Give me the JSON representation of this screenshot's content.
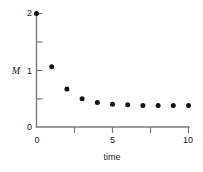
{
  "chart_data": {
    "type": "scatter",
    "title": "",
    "xlabel": "time",
    "ylabel": "M",
    "xlim": [
      0,
      10.5
    ],
    "ylim": [
      0,
      2.05
    ],
    "grid": false,
    "legend": null,
    "x": [
      0,
      1,
      2,
      3,
      4,
      5,
      6,
      7,
      8,
      9,
      10
    ],
    "values": [
      2.0,
      1.06,
      0.67,
      0.5,
      0.43,
      0.4,
      0.39,
      0.38,
      0.38,
      0.38,
      0.38
    ],
    "series": [
      {
        "name": "M",
        "values": [
          2.0,
          1.06,
          0.67,
          0.5,
          0.43,
          0.4,
          0.39,
          0.38,
          0.38,
          0.38,
          0.38
        ]
      }
    ],
    "marker": "filled-circle",
    "marker_color": "#141414",
    "axis_color": "#7a7a7a",
    "x_ticks": [
      {
        "value": 0,
        "label": "0",
        "major": true
      },
      {
        "value": 2.5,
        "label": "",
        "major": false
      },
      {
        "value": 5,
        "label": "5",
        "major": true
      },
      {
        "value": 7.5,
        "label": "",
        "major": false
      },
      {
        "value": 10,
        "label": "10",
        "major": true
      }
    ],
    "y_ticks": [
      {
        "value": 0,
        "label": "0",
        "major": true
      },
      {
        "value": 0.5,
        "label": "",
        "major": false
      },
      {
        "value": 1,
        "label": "1",
        "major": true
      },
      {
        "value": 1.5,
        "label": "",
        "major": false
      },
      {
        "value": 2,
        "label": "2",
        "major": true
      }
    ]
  },
  "labels": {
    "y_axis_title": "M",
    "x_axis_title": "time",
    "y_tick_0": "0",
    "y_tick_1": "1",
    "y_tick_2": "2",
    "x_tick_0": "0",
    "x_tick_5": "5",
    "x_tick_10": "10"
  }
}
